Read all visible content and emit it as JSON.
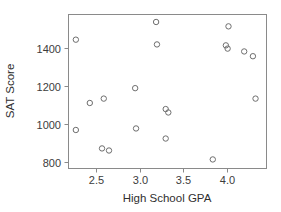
{
  "chart_data": {
    "type": "scatter",
    "title": "",
    "xlabel": "High School GPA",
    "ylabel": "SAT Score",
    "xlim": [
      2.18,
      4.45
    ],
    "ylim": [
      770,
      1580
    ],
    "xticks": [
      2.5,
      3.0,
      3.5,
      4.0
    ],
    "xtick_labels": [
      "2.5",
      "3.0",
      "3.5",
      "4.0"
    ],
    "yticks": [
      800,
      1000,
      1200,
      1400
    ],
    "ytick_labels": [
      "800",
      "1000",
      "1200",
      "1400"
    ],
    "grid": false,
    "legend": false,
    "marker": "open-circle",
    "marker_color": "#6e6e6e",
    "frame_color": "#8a8a8a",
    "points": [
      {
        "x": 2.27,
        "y": 1445
      },
      {
        "x": 2.27,
        "y": 970
      },
      {
        "x": 2.43,
        "y": 1112
      },
      {
        "x": 2.57,
        "y": 873
      },
      {
        "x": 2.59,
        "y": 1135
      },
      {
        "x": 2.65,
        "y": 862
      },
      {
        "x": 2.95,
        "y": 1190
      },
      {
        "x": 2.96,
        "y": 978
      },
      {
        "x": 3.19,
        "y": 1538
      },
      {
        "x": 3.2,
        "y": 1420
      },
      {
        "x": 3.3,
        "y": 1080
      },
      {
        "x": 3.33,
        "y": 1062
      },
      {
        "x": 3.3,
        "y": 925
      },
      {
        "x": 3.84,
        "y": 815
      },
      {
        "x": 4.02,
        "y": 1515
      },
      {
        "x": 3.99,
        "y": 1415
      },
      {
        "x": 4.01,
        "y": 1398
      },
      {
        "x": 4.2,
        "y": 1383
      },
      {
        "x": 4.3,
        "y": 1358
      },
      {
        "x": 4.33,
        "y": 1135
      }
    ]
  },
  "colors": {
    "marker_stroke": "#6e6e6e",
    "frame_stroke": "#8a8a8a",
    "text": "#3c3c3c",
    "background": "#ffffff"
  },
  "icons": {
    "point_marker": "open-circle-marker"
  }
}
